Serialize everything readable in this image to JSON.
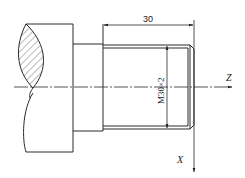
{
  "diagram": {
    "type": "engineering-drawing",
    "dimensions": {
      "length_label": "30",
      "thread_label": "M30×2"
    },
    "axes": {
      "z_label": "Z",
      "x_label": "X"
    },
    "colors": {
      "line": "#2a2a2a",
      "background": "#ffffff"
    }
  }
}
